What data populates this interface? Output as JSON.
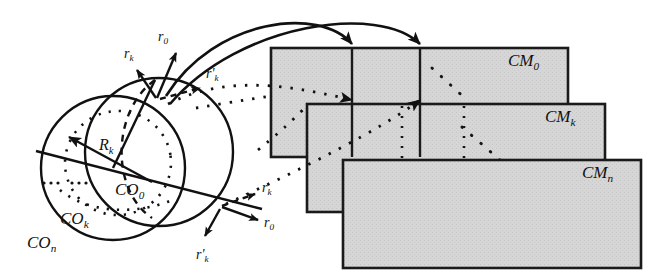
{
  "figure": {
    "background_color": "#ffffff",
    "stroke_color": "#111111",
    "panel_fill": "#d4d4d4",
    "panel_stroke": "#1a1a1a"
  },
  "circles": {
    "outer_label": "CO",
    "outer_sub": "n",
    "middle_label": "CO",
    "middle_sub": "k",
    "inner_label": "CO",
    "inner_sub": "0",
    "radius_label": "R",
    "radius_sub": "k"
  },
  "vectors_top": [
    {
      "name": "r",
      "sub": "k",
      "prime": ""
    },
    {
      "name": "r",
      "sub": "0",
      "prime": ""
    },
    {
      "name": "r",
      "sub": "k",
      "prime": "'"
    }
  ],
  "vectors_bottom": [
    {
      "name": "r",
      "sub": "k",
      "prime": ""
    },
    {
      "name": "r",
      "sub": "0",
      "prime": ""
    },
    {
      "name": "r",
      "sub": "k",
      "prime": "'"
    }
  ],
  "panels": [
    {
      "label": "CM",
      "sub": "0"
    },
    {
      "label": "CM",
      "sub": "k"
    },
    {
      "label": "CM",
      "sub": "n"
    }
  ],
  "icons": {
    "arrowhead": "arrowhead-icon",
    "ellipsis": "ellipsis-dots-icon"
  }
}
